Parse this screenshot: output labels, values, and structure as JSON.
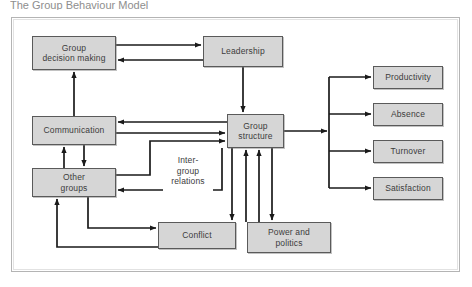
{
  "page": {
    "title_fragment": "The Group Behaviour Model",
    "background_color": "#ffffff",
    "frame": {
      "color": "#b4b4b4",
      "x": 11,
      "y": 17,
      "width": 449,
      "height": 255
    }
  },
  "style": {
    "node_fill": "#d6d6d6",
    "node_border": "#5a5a5a",
    "text_color": "#3c3c3c",
    "arrow_color": "#1a1a1a",
    "frame_color": "#b4b4b4"
  },
  "diagram": {
    "type": "flow-diagram",
    "nodes": [
      {
        "id": "group-decision-making",
        "label": "Group\ndecision making",
        "x": 32,
        "y": 36,
        "w": 84,
        "h": 34
      },
      {
        "id": "leadership",
        "label": "Leadership",
        "x": 203,
        "y": 36,
        "w": 80,
        "h": 31
      },
      {
        "id": "communication",
        "label": "Communication",
        "x": 32,
        "y": 116,
        "w": 84,
        "h": 29
      },
      {
        "id": "group-structure",
        "label": "Group\nstructure",
        "x": 227,
        "y": 114,
        "w": 57,
        "h": 34
      },
      {
        "id": "other-groups",
        "label": "Other\ngroups",
        "x": 32,
        "y": 168,
        "w": 84,
        "h": 29
      },
      {
        "id": "conflict",
        "label": "Conflict",
        "x": 158,
        "y": 222,
        "w": 78,
        "h": 27
      },
      {
        "id": "power-and-politics",
        "label": "Power and\npolitics",
        "x": 247,
        "y": 222,
        "w": 84,
        "h": 31
      },
      {
        "id": "productivity",
        "label": "Productivity",
        "x": 373,
        "y": 66,
        "w": 70,
        "h": 23
      },
      {
        "id": "absence",
        "label": "Absence",
        "x": 373,
        "y": 103,
        "w": 70,
        "h": 23
      },
      {
        "id": "turnover",
        "label": "Turnover",
        "x": 373,
        "y": 140,
        "w": 70,
        "h": 23
      },
      {
        "id": "satisfaction",
        "label": "Satisfaction",
        "x": 373,
        "y": 177,
        "w": 70,
        "h": 23
      }
    ],
    "free_labels": [
      {
        "id": "inter-group-relations",
        "label": "Inter-\ngroup\nrelations",
        "x": 163,
        "y": 155,
        "w": 50,
        "h": 36
      }
    ],
    "edges": [
      {
        "from": "group-decision-making",
        "to": "leadership"
      },
      {
        "from": "leadership",
        "to": "group-decision-making"
      },
      {
        "from": "communication",
        "to": "group-decision-making"
      },
      {
        "from": "leadership",
        "to": "group-structure"
      },
      {
        "from": "group-structure",
        "to": "communication"
      },
      {
        "from": "communication",
        "to": "group-structure"
      },
      {
        "from": "communication",
        "to": "other-groups"
      },
      {
        "from": "other-groups",
        "to": "communication"
      },
      {
        "from": "other-groups",
        "to": "group-structure"
      },
      {
        "from": "group-structure",
        "to": "other-groups",
        "label": "Inter-group relations"
      },
      {
        "from": "other-groups",
        "to": "conflict"
      },
      {
        "from": "conflict",
        "to": "other-groups"
      },
      {
        "from": "group-structure",
        "to": "conflict"
      },
      {
        "from": "conflict",
        "to": "group-structure"
      },
      {
        "from": "group-structure",
        "to": "power-and-politics"
      },
      {
        "from": "power-and-politics",
        "to": "group-structure"
      },
      {
        "from": "group-structure",
        "to": "productivity"
      },
      {
        "from": "group-structure",
        "to": "absence"
      },
      {
        "from": "group-structure",
        "to": "turnover"
      },
      {
        "from": "group-structure",
        "to": "satisfaction"
      }
    ]
  }
}
